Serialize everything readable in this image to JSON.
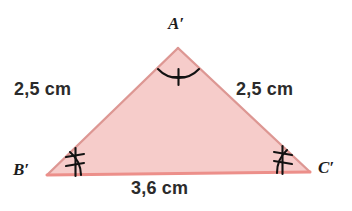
{
  "figure": {
    "colors": {
      "fill": "#f6ccca",
      "edge_slanted": "#e09b98",
      "edge_base": "#e8918c",
      "mark_stroke": "#111111",
      "text": "#2b2b2b",
      "background": "#ffffff"
    },
    "vertices": [
      {
        "name": "A-prime",
        "label": "A′",
        "x": 178,
        "y": 48
      },
      {
        "name": "B-prime",
        "label": "B′",
        "x": 47,
        "y": 175
      },
      {
        "name": "C-prime",
        "label": "C′",
        "x": 310,
        "y": 172
      }
    ],
    "sides": [
      {
        "name": "side-A-prime-B-prime",
        "label": "2,5 cm",
        "value": 2.5,
        "unit": "cm"
      },
      {
        "name": "side-A-prime-C-prime",
        "label": "2,5 cm",
        "value": 2.5,
        "unit": "cm"
      },
      {
        "name": "side-B-prime-C-prime",
        "label": "3,6 cm",
        "value": 3.6,
        "unit": "cm"
      }
    ],
    "angle_marks": [
      {
        "name": "angle-mark-A-prime",
        "vertex": "A′",
        "ticks": 1
      },
      {
        "name": "angle-mark-B-prime",
        "vertex": "B′",
        "ticks": 2
      },
      {
        "name": "angle-mark-C-prime",
        "vertex": "C′",
        "ticks": 2
      }
    ]
  }
}
